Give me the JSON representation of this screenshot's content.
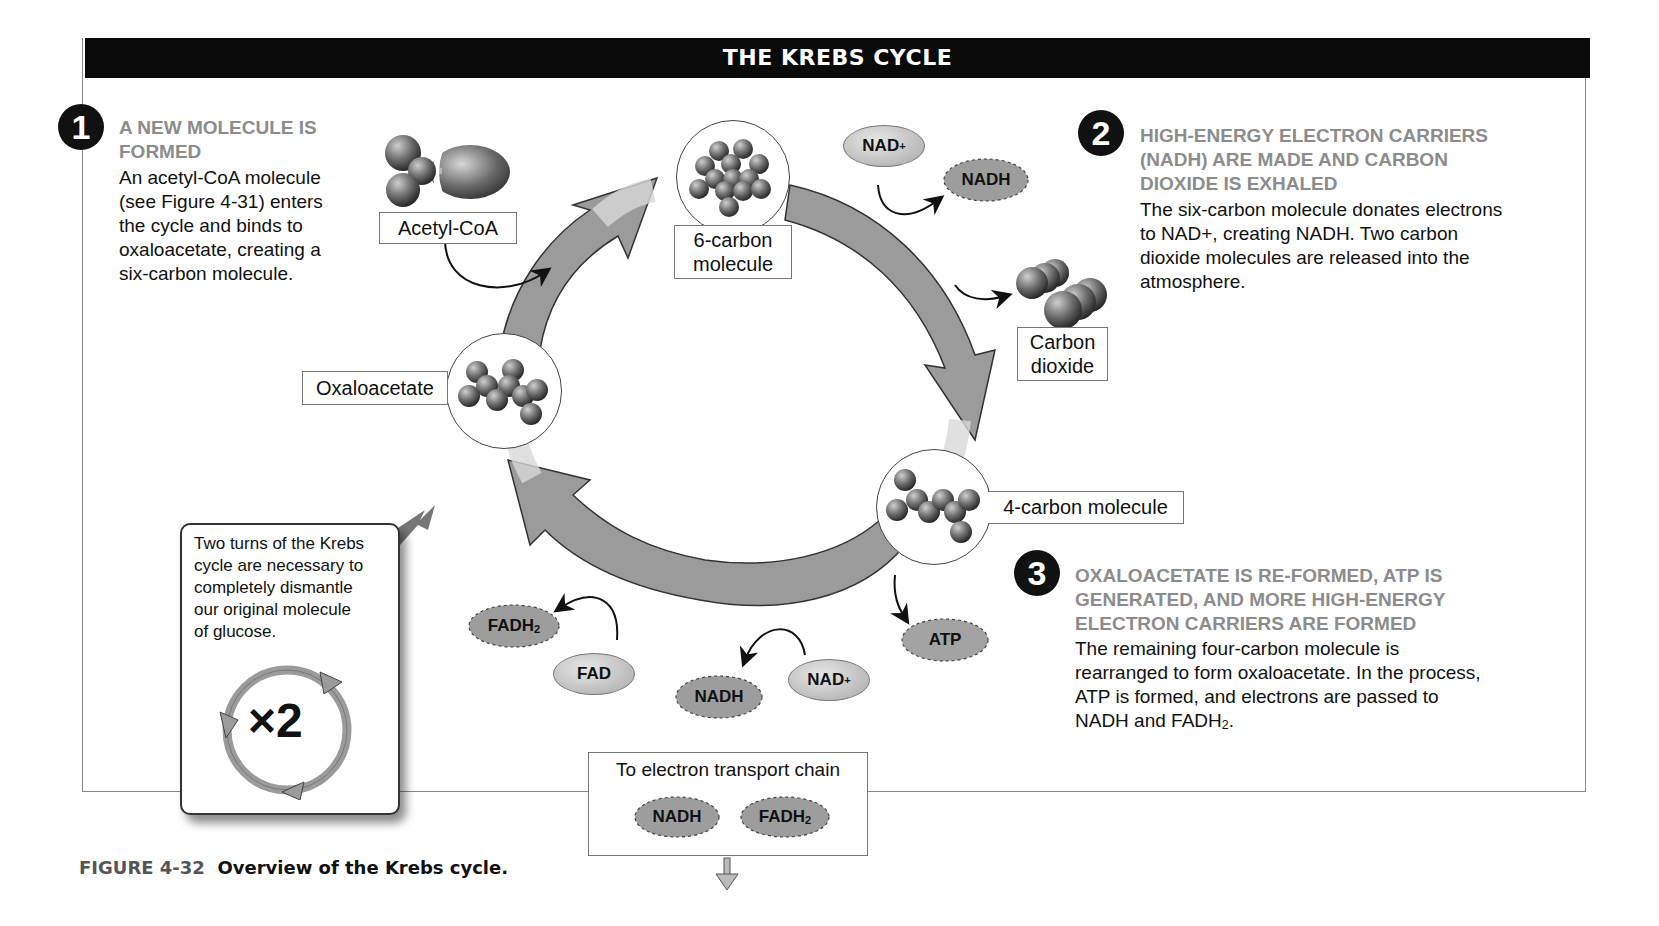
{
  "header": {
    "title": "THE KREBS CYCLE"
  },
  "steps": [
    {
      "number": "1",
      "heading": "A NEW MOLECULE IS FORMED",
      "heading_lines": [
        "A NEW MOLECULE IS",
        "FORMED"
      ],
      "body_lines": [
        "An acetyl-CoA molecule",
        "(see Figure 4-31) enters",
        "the cycle and binds to",
        "oxaloacetate, creating a",
        "six-carbon molecule."
      ]
    },
    {
      "number": "2",
      "heading_lines": [
        "HIGH-ENERGY ELECTRON CARRIERS",
        "(NADH) ARE MADE AND CARBON",
        "DIOXIDE IS EXHALED"
      ],
      "body_lines": [
        "The six-carbon molecule donates electrons",
        "to NAD+, creating NADH.  Two carbon",
        "dioxide molecules are released into the",
        "atmosphere."
      ]
    },
    {
      "number": "3",
      "heading_lines": [
        "OXALOACETATE IS RE-FORMED, ATP IS",
        "GENERATED, AND MORE HIGH-ENERGY",
        "ELECTRON CARRIERS ARE FORMED"
      ],
      "body_lines": [
        "The remaining four-carbon molecule is",
        "rearranged to form oxaloacetate. In the process,",
        "ATP is formed, and electrons are passed to",
        "NADH and FADH2."
      ]
    }
  ],
  "molecules": {
    "acetyl_coa": "Acetyl-CoA",
    "six_carbon_1": "6-carbon",
    "six_carbon_2": "molecule",
    "carbon_dioxide_1": "Carbon",
    "carbon_dioxide_2": "dioxide",
    "oxaloacetate": "Oxaloacetate",
    "four_carbon": "4-carbon molecule"
  },
  "carriers": {
    "nad_top": "NAD",
    "nadh_top": "NADH",
    "atp": "ATP",
    "fadh2_left": "FADH",
    "fad": "FAD",
    "nadh_bottom": "NADH",
    "nad_bottom": "NAD",
    "plus": "+",
    "sub2": "2"
  },
  "note": {
    "lines": [
      "Two turns of the Krebs",
      "cycle are necessary to",
      "completely dismantle",
      "our original molecule",
      "of glucose."
    ],
    "multiplier": "×2"
  },
  "etc": {
    "label": "To electron transport chain",
    "nadh": "NADH",
    "fadh2": "FADH"
  },
  "caption": {
    "figure": "FIGURE 4-32",
    "text": "Overview of the Krebs cycle."
  }
}
